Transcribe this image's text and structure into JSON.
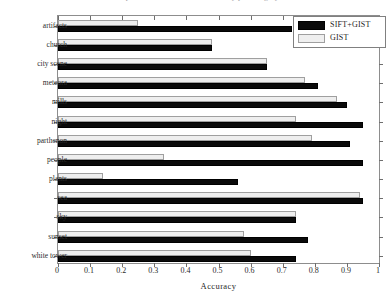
{
  "figure": {
    "title": "Comparison of classification accuracy per category",
    "axis_title": "Accuracy"
  },
  "legend": {
    "entries": [
      {
        "label": "SIFT+GIST",
        "color": "#0a0a0a",
        "swatch": "sift"
      },
      {
        "label": "GIST",
        "color": "#efefef",
        "swatch": "gist"
      }
    ]
  },
  "chart_data": {
    "type": "bar",
    "orientation": "horizontal",
    "title": "Comparison of classification accuracy per category",
    "xlabel": "Accuracy",
    "ylabel": "",
    "xlim": [
      0,
      1
    ],
    "xticks": [
      0,
      0.1,
      0.2,
      0.3,
      0.4,
      0.5,
      0.6,
      0.7,
      0.8,
      0.9,
      1
    ],
    "xtick_labels": [
      "0",
      "0.1",
      "0.2",
      "0.3",
      "0.4",
      "0.5",
      "0.6",
      "0.7",
      "0.8",
      "0.9",
      "1"
    ],
    "grid": false,
    "legend_position": "top-right",
    "categories": [
      "artifacts",
      "church",
      "city scene",
      "meteora",
      "mills",
      "night",
      "parthenon",
      "people",
      "plants",
      "sea",
      "sky",
      "sunset",
      "white tower"
    ],
    "series": [
      {
        "name": "SIFT+GIST",
        "color": "#0a0a0a",
        "values": [
          0.73,
          0.48,
          0.65,
          0.81,
          0.9,
          0.95,
          0.91,
          0.95,
          0.56,
          0.95,
          0.74,
          0.78,
          0.74
        ]
      },
      {
        "name": "GIST",
        "color": "#efefef",
        "values": [
          0.25,
          0.48,
          0.65,
          0.77,
          0.87,
          0.74,
          0.79,
          0.33,
          0.14,
          0.94,
          0.74,
          0.58,
          0.6
        ]
      }
    ]
  }
}
